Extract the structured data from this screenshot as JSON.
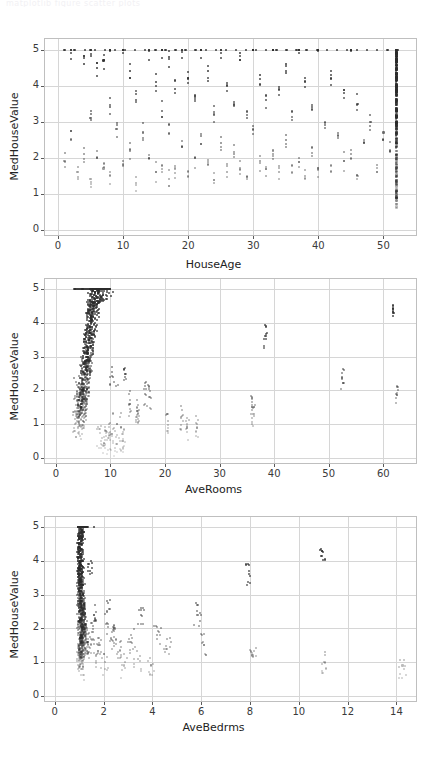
{
  "header": {
    "faint_text": "matplotlib    figure    scatter plots"
  },
  "figure": {
    "background": "#ffffff",
    "grid_color": "#d6d6d6",
    "frame_color": "#bfbfbf",
    "marker_color": "#2b2b2b"
  },
  "chart_data": [
    {
      "type": "scatter",
      "title": "",
      "xlabel": "HouseAge",
      "ylabel": "MedHouseValue",
      "xlim": [
        -2,
        55
      ],
      "ylim": [
        -0.15,
        5.3
      ],
      "xticks": [
        0,
        10,
        20,
        30,
        40,
        50
      ],
      "yticks": [
        0,
        1,
        2,
        3,
        4,
        5
      ],
      "grid": true,
      "legend": null,
      "points_note": "HouseAge is integer-valued, so points form discrete vertical columns; a dense saturated column sits at 52 (capped). MedHouseValue saturates at 5.00001 forming a solid top row.",
      "x": [
        1,
        2,
        2,
        3,
        4,
        4,
        5,
        5,
        5,
        6,
        6,
        7,
        7,
        8,
        8,
        8,
        9,
        10,
        10,
        11,
        11,
        12,
        12,
        13,
        14,
        14,
        15,
        15,
        16,
        16,
        16,
        17,
        17,
        17,
        18,
        18,
        19,
        19,
        20,
        20,
        21,
        21,
        22,
        22,
        23,
        23,
        24,
        24,
        25,
        25,
        26,
        26,
        27,
        27,
        28,
        28,
        29,
        29,
        30,
        30,
        31,
        31,
        32,
        32,
        33,
        33,
        34,
        34,
        35,
        35,
        36,
        36,
        37,
        37,
        38,
        38,
        39,
        39,
        40,
        40,
        41,
        42,
        42,
        43,
        44,
        44,
        45,
        45,
        46,
        46,
        47,
        48,
        49,
        50,
        51,
        52,
        52,
        52,
        52,
        52,
        52,
        52,
        52,
        52,
        52,
        52,
        52,
        52,
        52,
        52
      ],
      "y": [
        1.9,
        5.0,
        2.5,
        1.6,
        4.6,
        2.1,
        5.0,
        3.1,
        1.4,
        4.5,
        2.0,
        4.7,
        1.7,
        5.0,
        3.4,
        1.5,
        2.8,
        5.0,
        1.9,
        4.4,
        2.2,
        3.6,
        1.3,
        2.7,
        5.0,
        2.0,
        4.1,
        1.6,
        5.0,
        3.3,
        1.8,
        4.8,
        2.9,
        1.4,
        3.9,
        1.7,
        5.0,
        2.3,
        4.2,
        1.5,
        3.7,
        2.0,
        5.0,
        2.6,
        4.4,
        1.8,
        3.2,
        1.3,
        5.0,
        2.4,
        4.0,
        1.6,
        3.5,
        2.1,
        4.9,
        1.7,
        3.1,
        1.4,
        5.0,
        2.8,
        4.3,
        1.9,
        3.6,
        1.5,
        5.0,
        2.2,
        3.9,
        1.6,
        4.6,
        2.5,
        3.3,
        1.8,
        5.0,
        2.0,
        4.1,
        1.5,
        3.4,
        2.3,
        5.0,
        1.7,
        2.9,
        4.2,
        1.6,
        2.6,
        3.8,
        1.9,
        5.0,
        2.1,
        3.5,
        1.5,
        2.4,
        3.0,
        1.8,
        2.7,
        2.2,
        5.0,
        4.8,
        4.5,
        4.2,
        3.9,
        3.6,
        3.3,
        3.0,
        2.7,
        2.4,
        2.1,
        1.8,
        1.5,
        1.2,
        0.9
      ]
    },
    {
      "type": "scatter",
      "title": "",
      "xlabel": "AveRooms",
      "ylabel": "MedHouseValue",
      "xlim": [
        -2,
        66
      ],
      "ylim": [
        -0.15,
        5.3
      ],
      "xticks": [
        0,
        10,
        20,
        30,
        40,
        50,
        60
      ],
      "yticks": [
        0,
        1,
        2,
        3,
        4,
        5
      ],
      "grid": true,
      "legend": null,
      "points_note": "Dense cluster between AveRooms 3-9 spanning MedHouseValue 0.2-5.0, with sparse high-AveRooms outliers out to 62.",
      "x": [
        4.1,
        5.2,
        6.0,
        5.5,
        4.8,
        6.4,
        7.0,
        5.9,
        4.4,
        6.8,
        5.1,
        7.3,
        4.6,
        5.7,
        6.2,
        8.1,
        5.3,
        4.9,
        6.6,
        7.5,
        5.0,
        4.2,
        6.1,
        5.8,
        7.8,
        4.7,
        5.6,
        6.9,
        4.3,
        5.4,
        6.3,
        8.5,
        5.2,
        4.5,
        7.1,
        6.0,
        5.9,
        4.8,
        6.5,
        5.1,
        9.2,
        4.0,
        5.7,
        6.7,
        4.6,
        5.3,
        7.4,
        6.2,
        4.9,
        5.5,
        6.8,
        8.0,
        4.4,
        5.8,
        6.1,
        5.0,
        7.2,
        4.7,
        6.4,
        5.6,
        9.8,
        4.2,
        5.9,
        6.6,
        4.8,
        5.2,
        7.0,
        6.3,
        4.5,
        5.7,
        6.0,
        8.7,
        4.9,
        5.4,
        6.9,
        5.1,
        4.3,
        6.2,
        5.8,
        7.6,
        4.6,
        5.5,
        6.5,
        4.1,
        5.3,
        6.8,
        5.9,
        4.7,
        6.1,
        5.0,
        10.5,
        11.2,
        13.5,
        14.8,
        16.4,
        15.1,
        17.2,
        12.6,
        20.5,
        24.1,
        23.0,
        25.8,
        35.9,
        36.2,
        38.4,
        52.5,
        62.4,
        61.8,
        10.2,
        11.8,
        9.5,
        8.9,
        9.1,
        8.4,
        10.8,
        12.2
      ],
      "y": [
        2.1,
        2.8,
        3.5,
        2.4,
        1.7,
        4.1,
        4.6,
        3.2,
        1.9,
        5.0,
        2.2,
        4.8,
        1.5,
        2.9,
        3.8,
        5.0,
        2.6,
        1.8,
        4.3,
        5.0,
        2.0,
        1.4,
        3.6,
        3.1,
        5.0,
        1.6,
        2.7,
        4.5,
        1.3,
        2.3,
        3.9,
        5.0,
        2.5,
        1.5,
        4.7,
        3.4,
        3.0,
        1.7,
        4.2,
        2.1,
        5.0,
        1.2,
        2.8,
        4.4,
        1.6,
        2.4,
        5.0,
        3.7,
        1.8,
        2.6,
        4.6,
        5.0,
        1.4,
        3.1,
        3.5,
        2.0,
        4.9,
        1.5,
        4.0,
        2.7,
        5.0,
        1.1,
        3.2,
        4.1,
        1.7,
        2.2,
        4.7,
        3.8,
        1.3,
        2.9,
        3.4,
        5.0,
        1.9,
        2.5,
        4.5,
        2.0,
        1.2,
        3.6,
        3.0,
        5.0,
        1.5,
        2.6,
        4.2,
        0.9,
        2.3,
        4.6,
        3.1,
        1.6,
        3.5,
        1.8,
        2.4,
        1.0,
        1.6,
        1.4,
        1.9,
        1.3,
        1.8,
        2.4,
        1.1,
        0.9,
        1.2,
        0.9,
        1.5,
        1.3,
        3.6,
        2.4,
        1.9,
        4.3,
        0.7,
        0.5,
        0.6,
        0.4,
        0.8,
        0.6,
        0.3,
        0.5
      ]
    },
    {
      "type": "scatter",
      "title": "",
      "xlabel": "AveBedrms",
      "ylabel": "MedHouseValue",
      "xlim": [
        -0.4,
        14.8
      ],
      "ylim": [
        -0.15,
        5.3
      ],
      "xticks": [
        0,
        2,
        4,
        6,
        8,
        10,
        12,
        14
      ],
      "yticks": [
        0,
        1,
        2,
        3,
        4,
        5
      ],
      "grid": true,
      "legend": null,
      "points_note": "Very tight vertical cluster near AveBedrms ~1.0-1.3 spanning the full MedHouseValue range, with a thin tail of outliers to 14.",
      "x": [
        1.0,
        1.02,
        1.05,
        1.08,
        1.03,
        1.1,
        1.06,
        1.01,
        1.12,
        1.04,
        1.07,
        1.09,
        1.02,
        1.15,
        1.0,
        1.11,
        1.05,
        1.03,
        1.18,
        1.06,
        1.08,
        1.01,
        1.13,
        1.04,
        1.09,
        1.02,
        1.2,
        1.07,
        1.0,
        1.14,
        1.05,
        1.1,
        1.03,
        1.16,
        1.08,
        1.01,
        1.06,
        1.12,
        1.04,
        1.22,
        1.09,
        1.02,
        1.07,
        1.17,
        1.0,
        1.11,
        1.05,
        1.25,
        1.03,
        1.13,
        1.08,
        1.06,
        1.01,
        1.19,
        1.04,
        1.1,
        1.02,
        1.15,
        1.09,
        1.3,
        1.07,
        1.0,
        1.12,
        1.05,
        1.21,
        1.03,
        1.08,
        1.06,
        1.14,
        1.01,
        1.28,
        1.04,
        1.1,
        1.02,
        1.16,
        1.09,
        1.07,
        1.35,
        1.0,
        1.11,
        1.05,
        1.23,
        1.03,
        1.13,
        1.08,
        1.4,
        1.06,
        1.18,
        1.01,
        1.09,
        1.55,
        1.62,
        1.7,
        1.45,
        1.85,
        2.05,
        2.15,
        2.3,
        2.45,
        2.6,
        2.85,
        3.1,
        3.4,
        3.55,
        3.95,
        4.2,
        4.6,
        5.85,
        6.1,
        7.95,
        8.1,
        10.95,
        11.05,
        14.25
      ],
      "y": [
        2.5,
        3.1,
        1.8,
        4.2,
        2.2,
        3.6,
        1.5,
        4.8,
        2.9,
        1.9,
        3.3,
        2.6,
        5.0,
        1.4,
        4.5,
        2.1,
        3.8,
        1.7,
        2.4,
        4.0,
        1.3,
        3.5,
        2.8,
        5.0,
        1.6,
        4.3,
        2.0,
        3.1,
        1.2,
        4.7,
        2.5,
        1.8,
        3.9,
        2.2,
        4.1,
        1.5,
        5.0,
        2.7,
        3.4,
        1.9,
        2.3,
        4.4,
        1.4,
        3.0,
        2.6,
        4.9,
        1.7,
        2.1,
        3.7,
        1.3,
        4.6,
        2.4,
        3.2,
        1.8,
        5.0,
        2.0,
        4.0,
        1.5,
        2.9,
        1.6,
        3.5,
        2.2,
        4.8,
        1.2,
        2.7,
        3.8,
        1.9,
        4.2,
        2.5,
        3.3,
        1.4,
        1.7,
        4.5,
        2.8,
        2.1,
        3.6,
        1.1,
        1.5,
        4.1,
        2.3,
        0.9,
        1.8,
        3.0,
        2.6,
        4.7,
        1.3,
        1.6,
        2.0,
        3.4,
        0.8,
        1.9,
        2.4,
        1.2,
        3.7,
        1.5,
        1.0,
        2.5,
        1.7,
        2.0,
        1.3,
        0.9,
        1.6,
        1.1,
        2.4,
        0.9,
        1.8,
        1.4,
        2.4,
        1.5,
        3.6,
        1.2,
        4.3,
        1.0,
        0.9
      ]
    }
  ]
}
